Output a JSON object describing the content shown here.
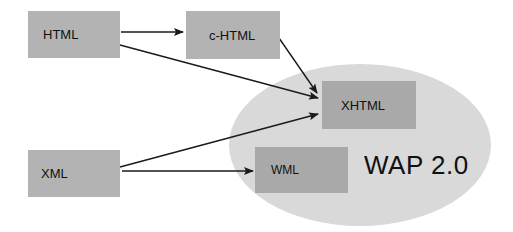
{
  "diagram": {
    "group": {
      "label": "WAP 2.0",
      "fill": "#d9d9d9"
    },
    "nodes": [
      {
        "id": "html",
        "label": "HTML",
        "fill": "#b3b3b3"
      },
      {
        "id": "chtml",
        "label": "c-HTML",
        "fill": "#b3b3b3"
      },
      {
        "id": "xhtml",
        "label": "XHTML",
        "fill": "#a9a9a9"
      },
      {
        "id": "xml",
        "label": "XML",
        "fill": "#b3b3b3"
      },
      {
        "id": "wml",
        "label": "WML",
        "fill": "#a9a9a9"
      }
    ],
    "edges": [
      {
        "from": "HTML",
        "to": "c-HTML"
      },
      {
        "from": "HTML",
        "to": "XHTML"
      },
      {
        "from": "c-HTML",
        "to": "XHTML"
      },
      {
        "from": "XML",
        "to": "XHTML"
      },
      {
        "from": "XML",
        "to": "WML"
      }
    ]
  }
}
